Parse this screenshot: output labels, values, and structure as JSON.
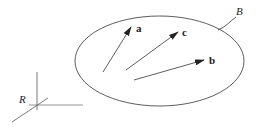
{
  "diagram": {
    "frame": {
      "label": "R"
    },
    "body": {
      "label": "B"
    },
    "vectors": [
      {
        "name": "a",
        "label": "a"
      },
      {
        "name": "c",
        "label": "c"
      },
      {
        "name": "b",
        "label": "b"
      }
    ],
    "colors": {
      "stroke": "#333333",
      "axis": "#555555"
    }
  }
}
